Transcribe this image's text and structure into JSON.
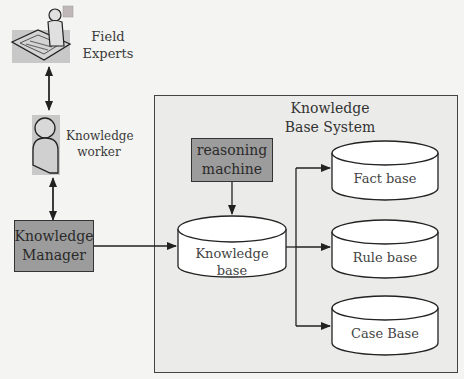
{
  "diagram": {
    "actors": {
      "field_experts": {
        "label_line1": "Field",
        "label_line2": "Experts",
        "icon": "person-at-desk-icon"
      },
      "knowledge_worker": {
        "label_line1": "Knowledge",
        "label_line2": "worker",
        "icon": "person-icon"
      }
    },
    "knowledge_manager": {
      "line1": "Knowledge",
      "line2": "Manager"
    },
    "system": {
      "title_line1": "Knowledge",
      "title_line2": "Base System",
      "reasoning_machine": {
        "line1": "reasoning",
        "line2": "machine"
      },
      "knowledge_base": {
        "line1": "Knowledge",
        "line2": "base"
      },
      "stores": [
        {
          "label": "Fact base"
        },
        {
          "label": "Rule base"
        },
        {
          "label": "Case Base"
        }
      ]
    },
    "colors": {
      "background": "#f4f4f2",
      "system_fill": "#ebebe9",
      "box_fill": "#9c9c9c",
      "cylinder_fill": "#ffffff",
      "stroke": "#333333"
    }
  }
}
